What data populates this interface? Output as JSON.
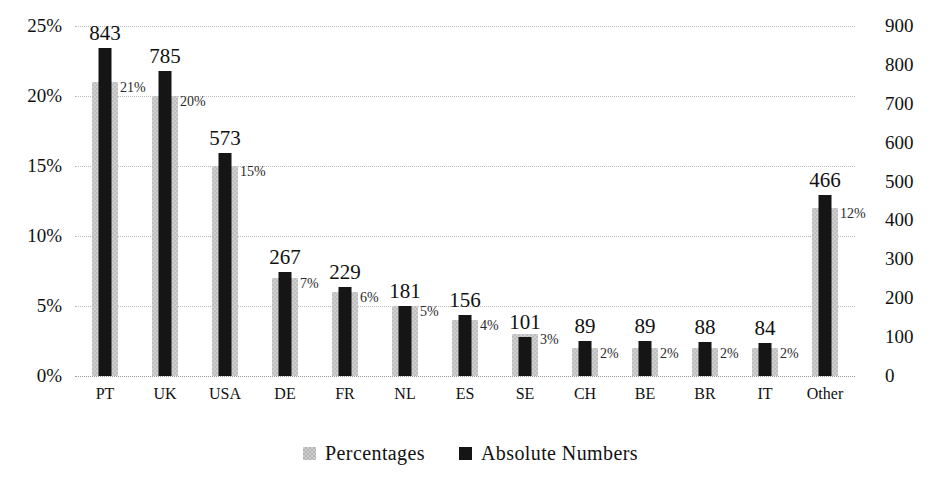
{
  "chart_data": {
    "type": "bar",
    "title": "",
    "subtitle": "",
    "xlabel": "",
    "ylabel": "",
    "grid": true,
    "legend_position": "bottom-center",
    "categories": [
      "PT",
      "UK",
      "USA",
      "DE",
      "FR",
      "NL",
      "ES",
      "SE",
      "CH",
      "BE",
      "BR",
      "IT",
      "Other"
    ],
    "axes": {
      "left": {
        "label": "",
        "ylim": [
          0,
          25
        ],
        "unit": "%",
        "ticks": [
          "0%",
          "5%",
          "10%",
          "15%",
          "20%",
          "25%"
        ],
        "tick_values": [
          0,
          5,
          10,
          15,
          20,
          25
        ]
      },
      "right": {
        "label": "",
        "ylim": [
          0,
          900
        ],
        "unit": "",
        "ticks": [
          "0",
          "100",
          "200",
          "300",
          "400",
          "500",
          "600",
          "700",
          "800",
          "900"
        ],
        "tick_values": [
          0,
          100,
          200,
          300,
          400,
          500,
          600,
          700,
          800,
          900
        ]
      }
    },
    "series": [
      {
        "name": "Percentages",
        "axis": "left",
        "color": "#cfcfcf",
        "values": [
          21,
          20,
          15,
          7,
          6,
          5,
          4,
          3,
          2,
          2,
          2,
          2,
          12
        ],
        "data_labels": [
          "21%",
          "20%",
          "15%",
          "7%",
          "6%",
          "5%",
          "4%",
          "3%",
          "2%",
          "2%",
          "2%",
          "2%",
          "12%"
        ]
      },
      {
        "name": "Absolute Numbers",
        "axis": "right",
        "color": "#151515",
        "values": [
          843,
          785,
          573,
          267,
          229,
          181,
          156,
          101,
          89,
          89,
          88,
          84,
          466
        ],
        "data_labels": [
          "843",
          "785",
          "573",
          "267",
          "229",
          "181",
          "156",
          "101",
          "89",
          "89",
          "88",
          "84",
          "466"
        ]
      }
    ]
  },
  "legend": {
    "items": [
      {
        "label": "Percentages",
        "swatch": "pct"
      },
      {
        "label": "Absolute Numbers",
        "swatch": "abs"
      }
    ]
  }
}
